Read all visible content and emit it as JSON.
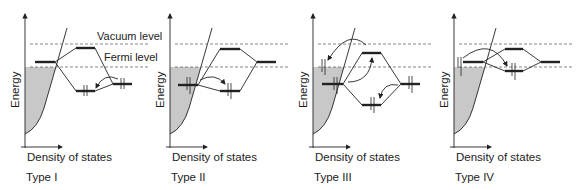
{
  "figure": {
    "title": "",
    "annotations": {
      "vacuum_level": "Vacuum level",
      "fermi_level": "Fermi level"
    },
    "axis_labels": {
      "y": "Energy",
      "x": "Density of states"
    },
    "panels": [
      {
        "id": "I",
        "label": "Type I"
      },
      {
        "id": "II",
        "label": "Type II"
      },
      {
        "id": "III",
        "label": "Type III"
      },
      {
        "id": "IV",
        "label": "Type IV"
      }
    ],
    "colors": {
      "line": "#222222",
      "dos_fill": "#c8c8c8",
      "dashed": "#666666"
    }
  }
}
